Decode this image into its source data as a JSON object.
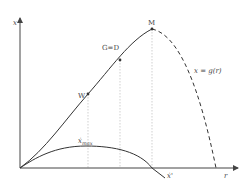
{
  "diagram": {
    "axes": {
      "y_label": "x",
      "x_label": "r"
    },
    "points": {
      "w": "W",
      "gd": "G=D",
      "m": "M"
    },
    "curve_label": "x = g(r)",
    "lower_curve": {
      "max_label": "ẋ",
      "max_sub": "max",
      "end_label": "ẋ'"
    },
    "colors": {
      "curve": "#333333",
      "guide": "#bbbbbb",
      "axis": "#444444"
    }
  }
}
